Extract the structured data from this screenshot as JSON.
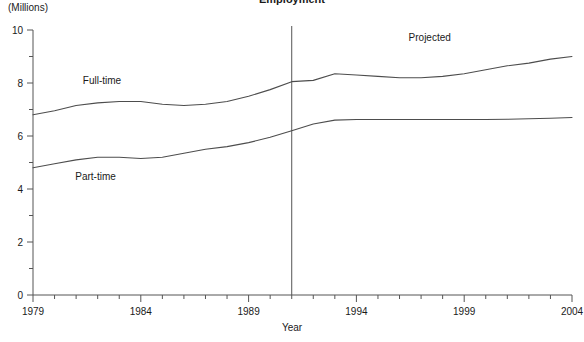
{
  "chart_data": {
    "type": "line",
    "title": "Employment",
    "unit_label": "(Millions)",
    "xlabel": "Year",
    "ylabel": "",
    "xlim": [
      1979,
      2004
    ],
    "ylim": [
      0,
      10
    ],
    "grid": false,
    "legend": "inline-labels",
    "x_ticks_major": [
      1979,
      1984,
      1989,
      1994,
      1999,
      2004
    ],
    "x_tick_labels": [
      "1979",
      "1984",
      "1989",
      "1994",
      "1999",
      "2004"
    ],
    "x_minor_step": 1,
    "y_ticks_major": [
      0,
      2,
      4,
      6,
      8,
      10
    ],
    "y_tick_labels": [
      "0",
      "2",
      "4",
      "6",
      "8",
      "10"
    ],
    "y_minor_ticks": [
      1,
      3,
      5,
      7,
      9
    ],
    "annotations": [
      {
        "text": "Projected",
        "x": 1997.4,
        "y": 9.6
      }
    ],
    "divider": {
      "x": 1991,
      "label": "projection-divider"
    },
    "x": [
      1979,
      1980,
      1981,
      1982,
      1983,
      1984,
      1985,
      1986,
      1987,
      1988,
      1989,
      1990,
      1991,
      1992,
      1993,
      1994,
      1995,
      1996,
      1997,
      1998,
      1999,
      2000,
      2001,
      2002,
      2003,
      2004
    ],
    "series": [
      {
        "name": "Full-time",
        "label": "Full-time",
        "label_x": 1982.2,
        "label_y": 7.95,
        "color": "#4d4d4d",
        "values": [
          6.8,
          6.95,
          7.15,
          7.25,
          7.3,
          7.3,
          7.2,
          7.15,
          7.2,
          7.3,
          7.5,
          7.75,
          8.05,
          8.1,
          8.35,
          8.3,
          8.25,
          8.2,
          8.2,
          8.25,
          8.35,
          8.5,
          8.65,
          8.75,
          8.9,
          9.0
        ]
      },
      {
        "name": "Part-time",
        "label": "Part-time",
        "label_x": 1981.9,
        "label_y": 4.35,
        "color": "#4d4d4d",
        "values": [
          4.8,
          4.95,
          5.1,
          5.2,
          5.2,
          5.15,
          5.2,
          5.35,
          5.5,
          5.6,
          5.75,
          5.95,
          6.2,
          6.45,
          6.6,
          6.62,
          6.62,
          6.62,
          6.62,
          6.62,
          6.62,
          6.62,
          6.63,
          6.65,
          6.67,
          6.7
        ]
      }
    ]
  }
}
